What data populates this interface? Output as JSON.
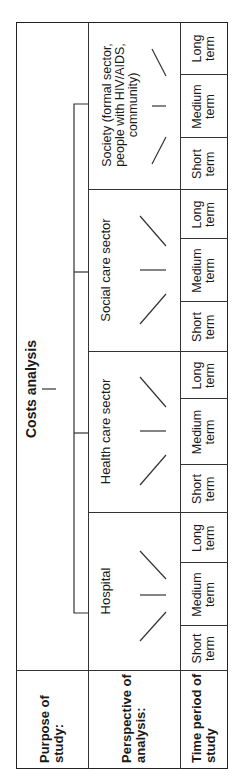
{
  "row_labels": {
    "purpose": "Purpose of study:",
    "perspective": "Perspective of analysis:",
    "time": "Time period of study"
  },
  "purpose": "Costs analysis",
  "perspectives": [
    {
      "label": "Hospital",
      "terms": [
        "Short term",
        "Medium term",
        "Long term"
      ]
    },
    {
      "label": "Health care sector",
      "terms": [
        "Short term",
        "Medium term",
        "Long term"
      ]
    },
    {
      "label": "Social care sector",
      "terms": [
        "Short term",
        "Medium term",
        "Long term"
      ]
    },
    {
      "label": "Society (formal sector, people with HIV/AIDS, community)",
      "terms": [
        "Short term",
        "Medium term",
        "Long term"
      ]
    }
  ],
  "colors": {
    "line": "#222222",
    "background": "#ffffff",
    "text": "#1a1a1a"
  }
}
